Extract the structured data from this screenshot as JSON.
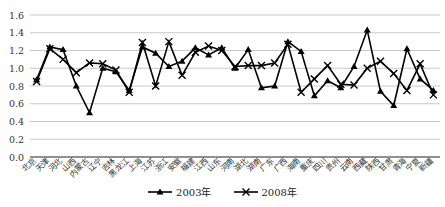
{
  "chart_data": {
    "type": "line",
    "title": "",
    "xlabel": "",
    "ylabel": "",
    "ylim": [
      0.0,
      1.6
    ],
    "yticks": [
      "0.0",
      "0.2",
      "0.4",
      "0.6",
      "0.8",
      "1.0",
      "1.2",
      "1.4",
      "1.6"
    ],
    "grid": true,
    "legend_position": "bottom",
    "categories": [
      "北京",
      "天津",
      "河北",
      "山西",
      "内蒙古",
      "辽宁",
      "吉林",
      "黑龙江",
      "上海",
      "江苏",
      "浙江",
      "安徽",
      "福建",
      "江西",
      "山东",
      "河南",
      "湖北",
      "湖南",
      "广东",
      "广西",
      "海南",
      "重庆",
      "四川",
      "贵州",
      "云南",
      "西藏",
      "陕西",
      "甘肃",
      "青海",
      "宁夏",
      "新疆"
    ],
    "series": [
      {
        "name": "2003年",
        "marker": "triangle",
        "values": [
          0.87,
          1.24,
          1.21,
          0.8,
          0.5,
          1.0,
          0.96,
          0.75,
          1.24,
          1.17,
          1.02,
          1.08,
          1.23,
          1.15,
          1.23,
          1.0,
          1.21,
          0.78,
          0.8,
          1.3,
          1.19,
          0.69,
          0.86,
          0.78,
          1.02,
          1.43,
          0.74,
          0.58,
          1.22,
          0.88,
          0.75
        ]
      },
      {
        "name": "2008年",
        "marker": "x",
        "values": [
          0.85,
          1.22,
          1.1,
          0.95,
          1.06,
          1.05,
          0.98,
          0.73,
          1.29,
          0.8,
          1.3,
          0.92,
          1.18,
          1.25,
          1.2,
          1.02,
          1.03,
          1.03,
          1.06,
          1.27,
          0.73,
          0.88,
          1.03,
          0.82,
          0.81,
          1.0,
          1.08,
          0.94,
          0.75,
          1.05,
          0.7
        ]
      }
    ]
  },
  "legend": {
    "s1": "2003年",
    "s2": "2008年"
  }
}
